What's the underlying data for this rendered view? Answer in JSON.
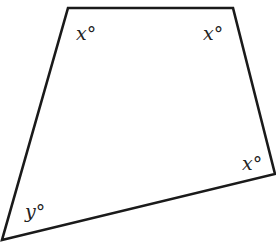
{
  "diagram": {
    "type": "quadrilateral",
    "stroke_color": "#1a1a1a",
    "vertices": [
      {
        "name": "top-left",
        "x": 68,
        "y": 8
      },
      {
        "name": "top-right",
        "x": 233,
        "y": 8
      },
      {
        "name": "right",
        "x": 275,
        "y": 174
      },
      {
        "name": "bottom-left",
        "x": 2,
        "y": 240
      }
    ],
    "angles": [
      {
        "vertex": "top-left",
        "label": "x°"
      },
      {
        "vertex": "top-right",
        "label": "x°"
      },
      {
        "vertex": "right",
        "label": "x°"
      },
      {
        "vertex": "bottom-left",
        "label": "y°"
      }
    ]
  }
}
